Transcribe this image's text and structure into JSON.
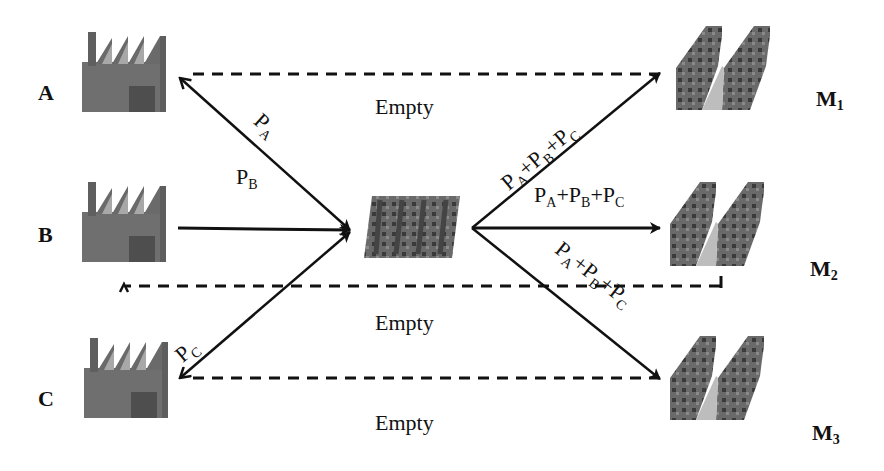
{
  "suppliers": [
    {
      "id": "A",
      "label": "A"
    },
    {
      "id": "B",
      "label": "B"
    },
    {
      "id": "C",
      "label": "C"
    }
  ],
  "hub": {
    "icon": "warehouse-hub-icon"
  },
  "markets": [
    {
      "id": "M1",
      "label": "M",
      "sub": "1"
    },
    {
      "id": "M2",
      "label": "M",
      "sub": "2"
    },
    {
      "id": "M3",
      "label": "M",
      "sub": "3"
    }
  ],
  "flows": {
    "a_to_hub": {
      "P": "P",
      "sub": "A"
    },
    "b_to_hub": {
      "P": "P",
      "sub": "B"
    },
    "c_to_hub": {
      "P": "P",
      "sub": "C"
    },
    "hub_to_markets": {
      "p1": "P",
      "s1": "A",
      "plus1": "+",
      "p2": "P",
      "s2": "B",
      "plus2": "+",
      "p3": "P",
      "s3": "C"
    }
  },
  "returns": {
    "m1_to_a": "Empty",
    "m2_to_b": "Empty",
    "m3_to_c": "Empty"
  },
  "colors": {
    "line": "#111111",
    "factory": "#6f6f6f",
    "factory_door": "#4e4e4e",
    "market": "#5c5c5c"
  }
}
